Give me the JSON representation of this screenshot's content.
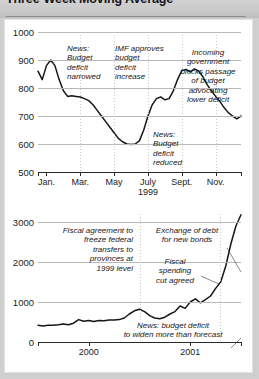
{
  "header": {
    "title": "Three-Week Moving Average"
  },
  "chart_data": [
    {
      "id": "top",
      "type": "line",
      "title": "Three-Week Moving Average",
      "xlabel": "1999",
      "ylabel": "",
      "ylim": [
        500,
        1000
      ],
      "yticks": [
        500,
        600,
        700,
        800,
        900,
        1000
      ],
      "ytick_labels": [
        "500",
        "600",
        "700",
        "800",
        "900",
        "1000"
      ],
      "xlim": [
        0,
        12
      ],
      "xticks": [
        0.5,
        2.5,
        4.5,
        6.5,
        8.5,
        10.5
      ],
      "xtick_labels": [
        "Jan.",
        "Mar.",
        "May",
        "July",
        "Sept.",
        "Nov."
      ],
      "xtick_sub": {
        "label": "1999",
        "at": 6.5
      },
      "grid": true,
      "vgrid_at": [
        2.5,
        4.5,
        6.5,
        8.5,
        10.5
      ],
      "x": [
        0.0,
        0.25,
        0.5,
        0.75,
        1.0,
        1.25,
        1.5,
        1.75,
        2.0,
        2.25,
        2.5,
        2.75,
        3.0,
        3.25,
        3.5,
        3.75,
        4.0,
        4.25,
        4.5,
        4.75,
        5.0,
        5.25,
        5.5,
        5.75,
        6.0,
        6.25,
        6.5,
        6.75,
        7.0,
        7.25,
        7.5,
        7.75,
        8.0,
        8.25,
        8.5,
        8.75,
        9.0,
        9.25,
        9.5,
        9.75,
        10.0,
        10.25,
        10.5,
        10.75,
        11.0,
        11.25,
        11.5,
        11.75,
        12.0
      ],
      "values": [
        860,
        830,
        880,
        900,
        880,
        830,
        790,
        770,
        772,
        770,
        768,
        762,
        755,
        740,
        720,
        700,
        680,
        660,
        640,
        620,
        608,
        600,
        598,
        600,
        612,
        650,
        700,
        740,
        762,
        768,
        758,
        762,
        790,
        830,
        862,
        866,
        858,
        868,
        860,
        840,
        812,
        790,
        770,
        752,
        730,
        712,
        700,
        690,
        700,
        672,
        640
      ],
      "annotations": [
        {
          "id": "news-budget-deficit-narrowed",
          "text": "News:\nBudget\ndeficit\nnarrowed",
          "align": "left"
        },
        {
          "id": "imf-approves-budget-deficit-increase",
          "text": "IMF approves\nbudget\ndeficit\nincrease",
          "align": "left"
        },
        {
          "id": "incoming-government-blocks-passage",
          "text": "Incoming\ngovernment\nblocks passage\nof budget\nadvocating\nlower deficit",
          "align": "center"
        },
        {
          "id": "news-budget-deficit-reduced",
          "text": "News:\nBudget\ndeficit\nreduced",
          "align": "left"
        }
      ]
    },
    {
      "id": "bottom",
      "type": "line",
      "title": "",
      "xlabel": "",
      "ylabel": "",
      "ylim": [
        0,
        3200
      ],
      "yticks": [
        0,
        1000,
        2000,
        3000
      ],
      "ytick_labels": [
        "0",
        "1000",
        "2000",
        "3000"
      ],
      "xlim": [
        0,
        24
      ],
      "xticks": [
        6,
        18
      ],
      "xtick_labels": [
        "2000",
        "2001"
      ],
      "grid": true,
      "vgrid_at": [
        12,
        21.5
      ],
      "x": [
        0,
        0.6,
        1.2,
        1.8,
        2.4,
        3.0,
        3.6,
        4.2,
        4.8,
        5.4,
        6.0,
        6.6,
        7.2,
        7.8,
        8.4,
        9.0,
        9.6,
        10.2,
        10.8,
        11.4,
        12.0,
        12.6,
        13.2,
        13.8,
        14.4,
        15.0,
        15.6,
        16.2,
        16.8,
        17.4,
        18.0,
        18.6,
        19.2,
        19.8,
        20.4,
        21.0,
        21.6,
        22.2,
        22.8,
        23.4,
        24.0
      ],
      "values": [
        420,
        400,
        420,
        418,
        430,
        450,
        432,
        470,
        560,
        520,
        540,
        512,
        540,
        530,
        552,
        548,
        560,
        600,
        700,
        780,
        820,
        760,
        660,
        600,
        580,
        620,
        700,
        760,
        900,
        840,
        1000,
        1080,
        980,
        1060,
        1150,
        1340,
        1500,
        1900,
        2450,
        2900,
        3180
      ],
      "annotations": [
        {
          "id": "fiscal-agreement-freeze-transfers",
          "text": "Fiscal agreement to\nfreeze federal\ntransfers to\nprovinces at\n1999 level",
          "align": "right"
        },
        {
          "id": "exchange-of-debt-for-new-bonds",
          "text": "Exchange of debt\nfor new bonds",
          "align": "center"
        },
        {
          "id": "fiscal-spending-cut-agreed",
          "text": "Fiscal\nspending\ncut agreed",
          "align": "center"
        },
        {
          "id": "news-budget-deficit-widen",
          "text": "News: budget deficit\nto widen more than forecast",
          "align": "center"
        }
      ]
    }
  ]
}
